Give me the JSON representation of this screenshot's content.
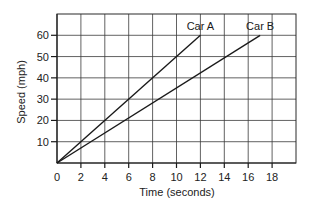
{
  "chart_data": {
    "type": "line",
    "title": "",
    "xlabel": "Time (seconds)",
    "ylabel": "Speed (mph)",
    "xlim": [
      0,
      20
    ],
    "ylim": [
      0,
      70
    ],
    "x_ticks": [
      0,
      2,
      4,
      6,
      8,
      10,
      12,
      14,
      16,
      18
    ],
    "y_ticks": [
      10,
      20,
      30,
      40,
      50,
      60
    ],
    "grid": true,
    "legend": "inline labels at line ends",
    "series": [
      {
        "name": "Car A",
        "x": [
          0,
          12
        ],
        "y": [
          0,
          60
        ]
      },
      {
        "name": "Car B",
        "x": [
          0,
          17
        ],
        "y": [
          0,
          60
        ]
      }
    ]
  }
}
